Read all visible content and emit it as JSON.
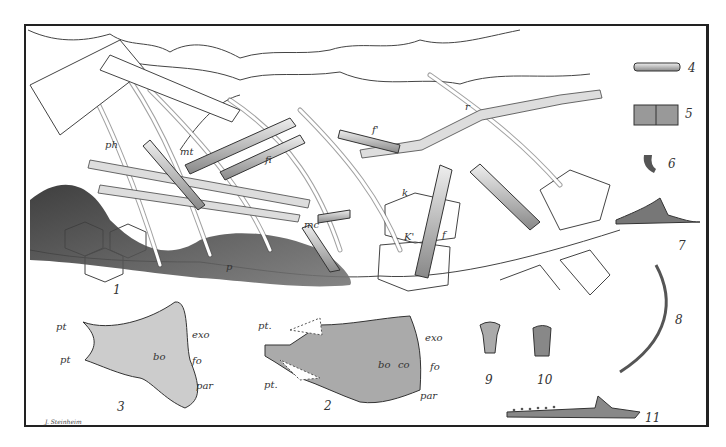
{
  "plate": {
    "figures": [
      {
        "id": "1",
        "label": "1",
        "description": "skeleton slab (main figure)"
      },
      {
        "id": "2",
        "label": "2",
        "description": "skull base, ventral view"
      },
      {
        "id": "3",
        "label": "3",
        "description": "skull base, second view"
      },
      {
        "id": "4",
        "label": "4",
        "description": "vertebra"
      },
      {
        "id": "5",
        "label": "5",
        "description": "vertebrae"
      },
      {
        "id": "6",
        "label": "6",
        "description": "claw"
      },
      {
        "id": "7",
        "label": "7",
        "description": "bone fragment"
      },
      {
        "id": "8",
        "label": "8",
        "description": "curved rib / spine"
      },
      {
        "id": "9",
        "label": "9",
        "description": "tooth"
      },
      {
        "id": "10",
        "label": "10",
        "description": "tooth"
      },
      {
        "id": "11",
        "label": "11",
        "description": "jaw with teeth"
      }
    ],
    "fig1_labels": {
      "ph": "ph",
      "mt": "mt",
      "fi": "fi",
      "f_prime": "f'",
      "r": "r",
      "k": "k",
      "k_prime": "K'",
      "f": "f",
      "mc": "mc",
      "p": "p"
    },
    "fig3_labels": {
      "pt_upper": "pt",
      "pt_lower": "pt",
      "exo": "exo",
      "bo": "bo",
      "fo": "fo",
      "par": "par"
    },
    "fig2_labels": {
      "pt_upper": "pt.",
      "pt_lower": "pt.",
      "exo": "exo",
      "bo": "bo",
      "co": "co",
      "fo": "fo",
      "par": "par"
    },
    "signature": "J. Steinheim"
  }
}
